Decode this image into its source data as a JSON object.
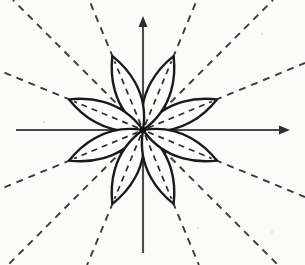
{
  "figure": {
    "background_color": "#fbfbfa",
    "canvas": {
      "width": 305,
      "height": 265
    }
  },
  "axes": {
    "name": "cartesian-axes",
    "color": "#4a4a4a",
    "stroke_width": 2.1,
    "origin": {
      "x": 143,
      "y": 130
    },
    "x_axis": {
      "label": "horizontal-axis",
      "x_start": 16,
      "x_end": 290,
      "y": 130,
      "arrow_at": "end",
      "arrow_direction": "right"
    },
    "y_axis": {
      "label": "vertical-axis",
      "x": 143,
      "y_start": 253,
      "y_end": 16,
      "arrow_at": "end",
      "arrow_direction": "up"
    },
    "arrow": {
      "length": 11,
      "half_width": 4.5,
      "color": "#2e2e2e"
    }
  },
  "chart_data": {
    "type": "line",
    "plot_kind": "polar-rose",
    "xlabel": "",
    "ylabel": "",
    "equation": "r = a*cos(4*theta)",
    "petal_count": 8,
    "petal_angular_spacing_deg": 45,
    "petal_angle_offset_deg": 22.5,
    "amplitude_px": 80,
    "petal_half_width_px": 13,
    "origin": {
      "x": 143,
      "y": 130
    },
    "grid": false,
    "legend": false,
    "xlim": [
      -127,
      147
    ],
    "ylim": [
      -123,
      114
    ],
    "petals": [
      {
        "id": "petal-1",
        "angle_deg": 22.5,
        "tip": {
          "x": 217,
          "y": 99
        },
        "length_px": 80
      },
      {
        "id": "petal-2",
        "angle_deg": 67.5,
        "tip": {
          "x": 174,
          "y": 56
        },
        "length_px": 80
      },
      {
        "id": "petal-3",
        "angle_deg": 112.5,
        "tip": {
          "x": 112,
          "y": 56
        },
        "length_px": 80
      },
      {
        "id": "petal-4",
        "angle_deg": 157.5,
        "tip": {
          "x": 69,
          "y": 99
        },
        "length_px": 80
      },
      {
        "id": "petal-5",
        "angle_deg": 202.5,
        "tip": {
          "x": 69,
          "y": 161
        },
        "length_px": 80
      },
      {
        "id": "petal-6",
        "angle_deg": 247.5,
        "tip": {
          "x": 112,
          "y": 204
        },
        "length_px": 80
      },
      {
        "id": "petal-7",
        "angle_deg": 292.5,
        "tip": {
          "x": 174,
          "y": 204
        },
        "length_px": 80
      },
      {
        "id": "petal-8",
        "angle_deg": 337.5,
        "tip": {
          "x": 217,
          "y": 161
        },
        "length_px": 80
      }
    ],
    "asymptote_rays": {
      "description": "Dashed rays from the origin along each petal axis, extending beyond the petals to the edge of the figure",
      "count": 16,
      "style": "dashed",
      "dash_pattern": "7 6",
      "color": "#3a3a3a",
      "angles_deg": [
        0,
        22.5,
        45,
        67.5,
        90,
        112.5,
        135,
        157.5,
        180,
        202.5,
        225,
        247.5,
        270,
        292.5,
        315,
        337.5
      ],
      "drawn_angles_deg": [
        22.5,
        45,
        67.5,
        112.5,
        135,
        157.5,
        202.5,
        225,
        247.5,
        292.5,
        315,
        337.5
      ]
    },
    "petal_midlines": {
      "description": "Dashed centre line running the length of each petal",
      "style": "dashed",
      "dash_pattern": "6 5",
      "color": "#2b2b2b"
    }
  },
  "colors": {
    "ink": "#1a1a1a",
    "axis": "#4a4a4a",
    "dash": "#3a3a3a",
    "petal_fill": "#fdfdfc",
    "background": "#fbfbfa"
  }
}
